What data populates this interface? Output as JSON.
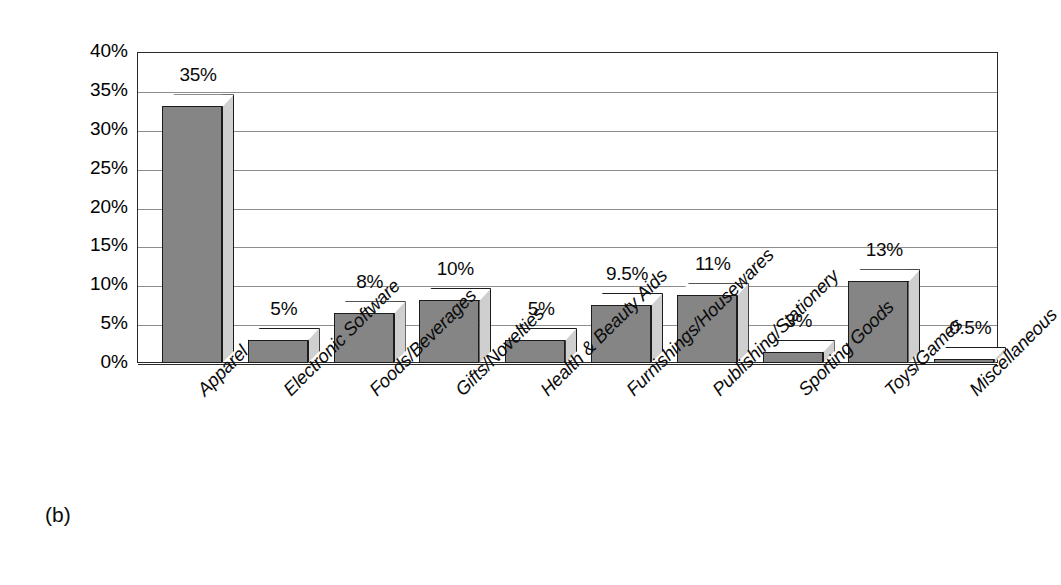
{
  "caption": "(b)",
  "chart_data": {
    "type": "bar",
    "title": "",
    "subtitle": "",
    "xlabel": "",
    "ylabel": "",
    "ylim": [
      0,
      40
    ],
    "ytick_labels": [
      "40%",
      "35%",
      "30%",
      "25%",
      "20%",
      "15%",
      "10%",
      "5%",
      "0%"
    ],
    "ytick_values": [
      40,
      35,
      30,
      25,
      20,
      15,
      10,
      5,
      0
    ],
    "grid": true,
    "legend": "none",
    "orientation": "vertical",
    "style": "3d-column",
    "categories": [
      "Apparel",
      "Electronic Software",
      "Foods/Beverages",
      "Gifts/Novelties",
      "Health & Beauty Aids",
      "Furnishings/Housewares",
      "Publishing/Stationery",
      "Sporting Goods",
      "Toys/Games",
      "Miscellaneous"
    ],
    "values": [
      35,
      5,
      8,
      10,
      5,
      9.5,
      11,
      3,
      13,
      0.5
    ],
    "value_labels": [
      "35%",
      "5%",
      "8%",
      "10%",
      "5%",
      "9.5%",
      "11%",
      "3%",
      "13%",
      "0.5%"
    ],
    "drawn_heights": [
      33,
      3,
      6.4,
      8.1,
      3,
      7.5,
      8.7,
      1.4,
      10.5,
      0.4
    ],
    "colors": {
      "bar_front": "#858585",
      "bar_top": "#ffffff",
      "bar_side": "#cfcfcf",
      "bar_outline": "#1c1c1c",
      "gridline": "#8d8d8d",
      "frame": "#2b2b2b",
      "text": "#0b0b0b",
      "background": "#ffffff"
    }
  }
}
